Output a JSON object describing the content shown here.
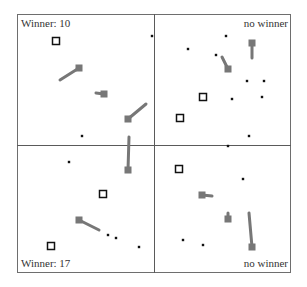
{
  "panels": [
    {
      "id": "top-left",
      "label": "Winner: 10"
    },
    {
      "id": "top-right",
      "label": "no winner"
    },
    {
      "id": "bottom-left",
      "label": "Winner: 17"
    },
    {
      "id": "bottom-right",
      "label": "no winner"
    }
  ],
  "colors": {
    "agent": "#777777",
    "dot": "#111111",
    "target_outline": "#111111",
    "grid": "#5a5a5a"
  },
  "elements": {
    "dots": [
      [
        152,
        36
      ],
      [
        82,
        136
      ],
      [
        226,
        36
      ],
      [
        188,
        49
      ],
      [
        216,
        55
      ],
      [
        247,
        81
      ],
      [
        264,
        81
      ],
      [
        232,
        99
      ],
      [
        262,
        97
      ],
      [
        249,
        136
      ],
      [
        228,
        146
      ],
      [
        69,
        162
      ],
      [
        108,
        235
      ],
      [
        116,
        238
      ],
      [
        139,
        247
      ],
      [
        243,
        179
      ],
      [
        183,
        240
      ],
      [
        203,
        245
      ]
    ],
    "hollow_squares": [
      [
        56,
        41
      ],
      [
        203,
        97
      ],
      [
        180,
        118
      ],
      [
        103,
        194
      ],
      [
        51,
        246
      ],
      [
        179,
        169
      ]
    ],
    "agents": [
      {
        "square": [
          79,
          68
        ],
        "tail": [
          60,
          80
        ]
      },
      {
        "square": [
          104,
          94
        ],
        "tail": [
          96,
          93
        ]
      },
      {
        "square": [
          128,
          119
        ],
        "tail": [
          146,
          104
        ]
      },
      {
        "square": [
          128,
          170
        ],
        "tail": [
          129,
          137
        ]
      },
      {
        "square": [
          252,
          43
        ],
        "tail": [
          252,
          58
        ]
      },
      {
        "square": [
          228,
          69
        ],
        "tail": [
          222,
          57
        ]
      },
      {
        "square": [
          79,
          220
        ],
        "tail": [
          99,
          230
        ]
      },
      {
        "square": [
          202,
          195
        ],
        "tail": [
          212,
          196
        ]
      },
      {
        "square": [
          228,
          219
        ],
        "tail": [
          228,
          213
        ]
      },
      {
        "square": [
          252,
          247
        ],
        "tail": [
          249,
          213
        ]
      }
    ]
  }
}
